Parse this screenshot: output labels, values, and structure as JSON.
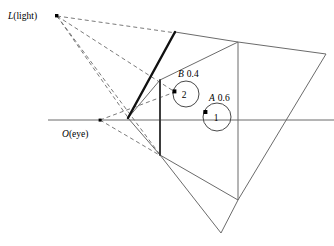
{
  "figure": {
    "title": "",
    "type": "geometric-optics-diagram",
    "background": "#ffffff",
    "stroke_color": "#555555",
    "thick_stroke_color": "#1a1a1a",
    "dash_color": "#666666",
    "labels": {
      "light": {
        "italic_part": "L",
        "rest": "(light)",
        "full": "L(light)",
        "x": 8,
        "y": 19
      },
      "eye": {
        "italic_part": "O",
        "rest": "(eye)",
        "full": "O(eye)",
        "x": 62,
        "y": 137
      },
      "surface_b": {
        "name": "B",
        "value": "0.4",
        "full": "B 0.4",
        "x": 178,
        "y": 77
      },
      "surface_a": {
        "name": "A",
        "value": "0.6",
        "full": "A 0.6",
        "x": 209,
        "y": 101
      },
      "circle_b_number": {
        "text": "2",
        "x": 186,
        "y": 97
      },
      "circle_a_number": {
        "text": "1",
        "x": 218,
        "y": 121
      }
    },
    "points": {
      "light_source": {
        "x": 57,
        "y": 16,
        "marker": "square-dot"
      },
      "eye_point": {
        "x": 100,
        "y": 120,
        "marker": "square-dot"
      },
      "b_sample_point": {
        "x": 174,
        "y": 91,
        "marker": "square-dot"
      },
      "a_sample_point": {
        "x": 205,
        "y": 112,
        "marker": "square-dot"
      }
    },
    "circles": {
      "b": {
        "cx": 186,
        "cy": 94,
        "r": 13
      },
      "a": {
        "cx": 217,
        "cy": 117,
        "r": 14
      }
    },
    "geometry": {
      "horizontal_axis": {
        "x1": 48,
        "y1": 120,
        "x2": 334,
        "y2": 120
      },
      "thick_wall": {
        "x1": 175,
        "y1": 32,
        "x2": 128,
        "y2": 118
      },
      "thick_vertical": {
        "x1": 160,
        "y1": 80,
        "x2": 160,
        "y2": 155
      },
      "outer_polygon": "175,32 238,42 326,54 238,200 221,233 160,155 128,118",
      "inner_edges": [
        "160,80 238,42",
        "160,80 128,118",
        "238,42 238,200",
        "160,155 238,200"
      ],
      "dashed_rays": [
        "57,16 175,32",
        "57,16 174,91",
        "57,16 128,118",
        "57,16 160,155",
        "100,120 174,91",
        "100,120 160,155"
      ]
    }
  }
}
